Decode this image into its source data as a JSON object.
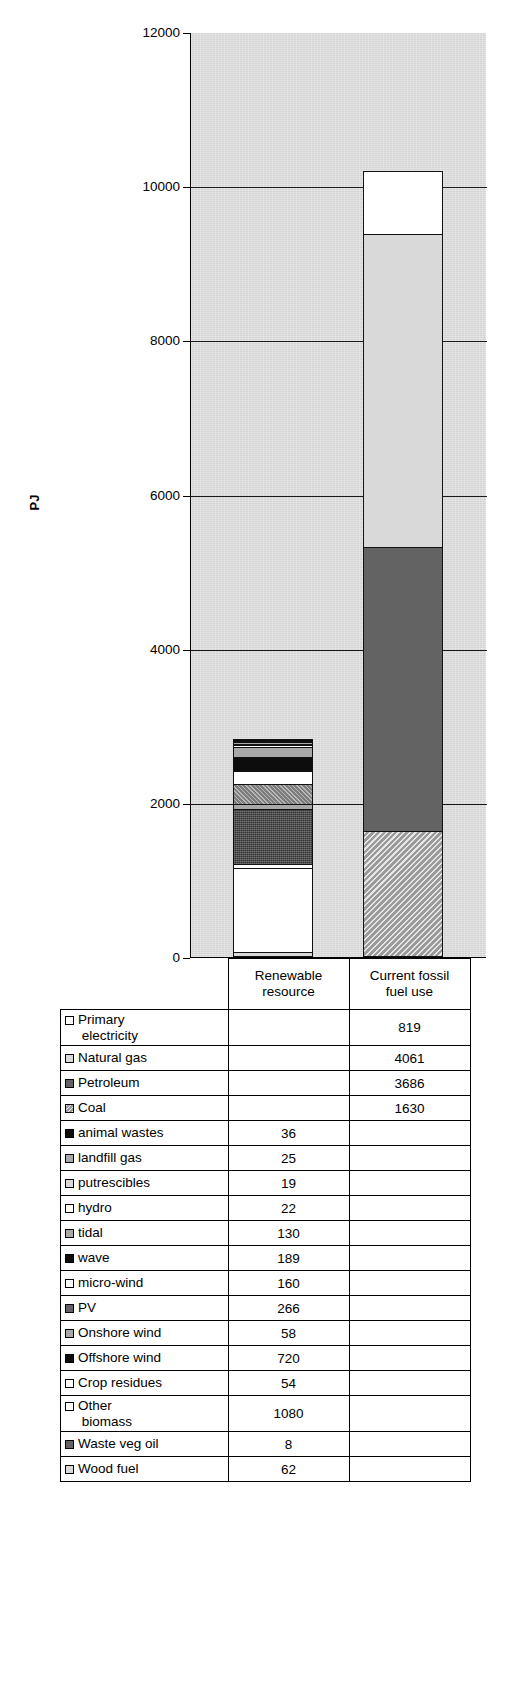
{
  "chart_data": {
    "type": "bar",
    "subtype": "stacked-column",
    "title": "",
    "xlabel": "",
    "ylabel": "PJ",
    "ylim": [
      0,
      12000
    ],
    "yticks": [
      "0",
      "2000",
      "4000",
      "6000",
      "8000",
      "10000",
      "12000"
    ],
    "grid": true,
    "legend": "none-inline-datatable",
    "categories": [
      "Renewable resource",
      "Current fossil fuel use"
    ],
    "series": [
      {
        "name": "Primary electricity",
        "values": [
          null,
          819
        ],
        "key": "white",
        "stack_order": 1
      },
      {
        "name": "Natural gas",
        "values": [
          null,
          4061
        ],
        "key": "light-grey",
        "stack_order": 2
      },
      {
        "name": "Petroleum",
        "values": [
          null,
          3686
        ],
        "key": "dark-grey",
        "stack_order": 3
      },
      {
        "name": "Coal",
        "values": [
          null,
          1630
        ],
        "key": "hatch-grey",
        "stack_order": 4
      },
      {
        "name": "animal wastes",
        "values": [
          36,
          null
        ],
        "key": "black",
        "stack_order": 5
      },
      {
        "name": "landfill gas",
        "values": [
          25,
          null
        ],
        "key": "mid-grey",
        "stack_order": 6
      },
      {
        "name": "putrescibles",
        "values": [
          19,
          null
        ],
        "key": "light-grey",
        "stack_order": 7
      },
      {
        "name": "hydro",
        "values": [
          22,
          null
        ],
        "key": "white",
        "stack_order": 8
      },
      {
        "name": "tidal",
        "values": [
          130,
          null
        ],
        "key": "mid-grey",
        "stack_order": 9
      },
      {
        "name": "wave",
        "values": [
          189,
          null
        ],
        "key": "black",
        "stack_order": 10
      },
      {
        "name": "micro-wind",
        "values": [
          160,
          null
        ],
        "key": "white",
        "stack_order": 11
      },
      {
        "name": "PV",
        "values": [
          266,
          null
        ],
        "key": "dark-grey",
        "stack_order": 12
      },
      {
        "name": "Onshore wind",
        "values": [
          58,
          null
        ],
        "key": "mid-grey",
        "stack_order": 13
      },
      {
        "name": "Offshore wind",
        "values": [
          720,
          null
        ],
        "key": "black",
        "stack_order": 14
      },
      {
        "name": "Crop residues",
        "values": [
          54,
          null
        ],
        "key": "white",
        "stack_order": 15
      },
      {
        "name": "Other biomass",
        "values": [
          1080,
          null
        ],
        "key": "white",
        "stack_order": 16
      },
      {
        "name": "Waste veg oil",
        "values": [
          8,
          null
        ],
        "key": "dark-grey",
        "stack_order": 17
      },
      {
        "name": "Wood fuel",
        "values": [
          62,
          null
        ],
        "key": "light-grey",
        "stack_order": 18
      }
    ],
    "totals": {
      "Renewable resource": 2829,
      "Current fossil fuel use": 10196
    }
  },
  "axis": {
    "y_title": "PJ",
    "ticks": [
      {
        "label": "12000",
        "value": 12000
      },
      {
        "label": "10000",
        "value": 10000
      },
      {
        "label": "8000",
        "value": 8000
      },
      {
        "label": "6000",
        "value": 6000
      },
      {
        "label": "4000",
        "value": 4000
      },
      {
        "label": "2000",
        "value": 2000
      },
      {
        "label": "0",
        "value": 0
      }
    ]
  },
  "table": {
    "columns": [
      {
        "line1": "Renewable",
        "line2": "resource"
      },
      {
        "line1": "Current fossil",
        "line2": "fuel use"
      }
    ],
    "rows": [
      {
        "swatch": "white",
        "line1": "Primary",
        "line2": "electricity",
        "renewable": "",
        "fossil": "819"
      },
      {
        "swatch": "light-grey",
        "line1": "Natural gas",
        "line2": "",
        "renewable": "",
        "fossil": "4061"
      },
      {
        "swatch": "dark-grey",
        "line1": "Petroleum",
        "line2": "",
        "renewable": "",
        "fossil": "3686"
      },
      {
        "swatch": "hatch-grey",
        "line1": "Coal",
        "line2": "",
        "renewable": "",
        "fossil": "1630"
      },
      {
        "swatch": "black",
        "line1": "animal wastes",
        "line2": "",
        "renewable": "36",
        "fossil": ""
      },
      {
        "swatch": "mid-grey",
        "line1": "landfill gas",
        "line2": "",
        "renewable": "25",
        "fossil": ""
      },
      {
        "swatch": "light-grey",
        "line1": "putrescibles",
        "line2": "",
        "renewable": "19",
        "fossil": ""
      },
      {
        "swatch": "white",
        "line1": "hydro",
        "line2": "",
        "renewable": "22",
        "fossil": ""
      },
      {
        "swatch": "mid-grey",
        "line1": "tidal",
        "line2": "",
        "renewable": "130",
        "fossil": ""
      },
      {
        "swatch": "black",
        "line1": "wave",
        "line2": "",
        "renewable": "189",
        "fossil": ""
      },
      {
        "swatch": "white",
        "line1": "micro-wind",
        "line2": "",
        "renewable": "160",
        "fossil": ""
      },
      {
        "swatch": "dark-grey",
        "line1": "PV",
        "line2": "",
        "renewable": "266",
        "fossil": ""
      },
      {
        "swatch": "mid-grey",
        "line1": "Onshore wind",
        "line2": "",
        "renewable": "58",
        "fossil": ""
      },
      {
        "swatch": "black",
        "line1": "Offshore wind",
        "line2": "",
        "renewable": "720",
        "fossil": ""
      },
      {
        "swatch": "white",
        "line1": "Crop residues",
        "line2": "",
        "renewable": "54",
        "fossil": ""
      },
      {
        "swatch": "white",
        "line1": "Other",
        "line2": "biomass",
        "renewable": "1080",
        "fossil": ""
      },
      {
        "swatch": "dark-grey",
        "line1": "Waste veg oil",
        "line2": "",
        "renewable": "8",
        "fossil": ""
      },
      {
        "swatch": "light-grey",
        "line1": "Wood fuel",
        "line2": "",
        "renewable": "62",
        "fossil": ""
      }
    ]
  },
  "colors": {
    "white": "#ffffff",
    "light-grey": "#d9d9d9",
    "mid-grey": "#a8a8a8",
    "dark-grey": "#636363",
    "black": "#0d0d0d",
    "hatch-grey": "#9a9a9a",
    "plot-background": "#d4d4d4",
    "axis": "#000000"
  }
}
